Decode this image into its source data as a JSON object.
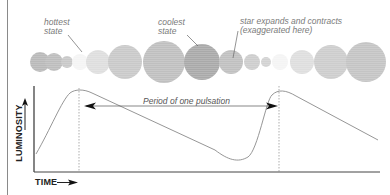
{
  "labels": {
    "hottest": "hottest\nstate",
    "coolest": "coolest\nstate",
    "expands": "star expands and contracts\n(exaggerated here)",
    "period": "Period of one pulsation",
    "y_axis": "LUMINOSITY",
    "x_axis": "TIME"
  },
  "colors": {
    "curve": "#8a8a8a",
    "axis": "#333333",
    "dotted_line": "#777777",
    "label": "#7a7a7a"
  },
  "stars": [
    {
      "cx": 40,
      "r": 10,
      "color": "#b9b9b9"
    },
    {
      "cx": 54,
      "r": 9,
      "color": "#bdbdbd"
    },
    {
      "cx": 67,
      "r": 6,
      "color": "#c8c8c8"
    },
    {
      "cx": 80,
      "r": 8,
      "color": "#f4f4f4"
    },
    {
      "cx": 98,
      "r": 12,
      "color": "#dedede"
    },
    {
      "cx": 125,
      "r": 17,
      "color": "#c9c9c9"
    },
    {
      "cx": 164,
      "r": 21,
      "color": "#bfbfbf"
    },
    {
      "cx": 202,
      "r": 18,
      "color": "#a9a9a9"
    },
    {
      "cx": 231,
      "r": 12,
      "color": "#c0c0c0"
    },
    {
      "cx": 252,
      "r": 8,
      "color": "#cdcdcd"
    },
    {
      "cx": 266,
      "r": 5,
      "color": "#d2d2d2"
    },
    {
      "cx": 280,
      "r": 8,
      "color": "#f4f4f4"
    },
    {
      "cx": 302,
      "r": 12,
      "color": "#dedede"
    },
    {
      "cx": 331,
      "r": 17,
      "color": "#cdcdcd"
    },
    {
      "cx": 366,
      "r": 20,
      "color": "#c4c4c4"
    }
  ],
  "chart_data": {
    "type": "line",
    "title": "",
    "xlabel": "TIME",
    "ylabel": "LUMINOSITY",
    "annotation": "Period of one pulsation",
    "x": [
      0,
      1,
      2,
      3,
      4,
      5,
      6,
      7,
      8,
      9,
      10
    ],
    "values": [
      0.25,
      0.95,
      0.85,
      0.65,
      0.45,
      0.2,
      0.1,
      0.6,
      0.95,
      0.75,
      0.45
    ],
    "peak_markers": [
      2,
      8
    ],
    "grid": false
  }
}
